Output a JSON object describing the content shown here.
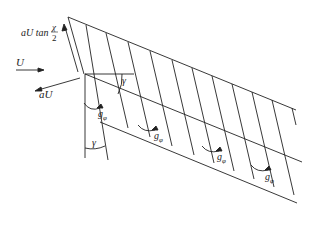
{
  "diagram": {
    "labels": {
      "velocity_u": "U",
      "induced_au": "aU",
      "tan_prefix": "aU tan",
      "chi_num": "χ",
      "chi_den": "2",
      "gamma_top": "γ",
      "gamma_bottom": "γ",
      "g_phi": "g",
      "g_phi_sub": "φ"
    },
    "colors": {
      "line": "#222222",
      "background": "#ffffff"
    }
  }
}
